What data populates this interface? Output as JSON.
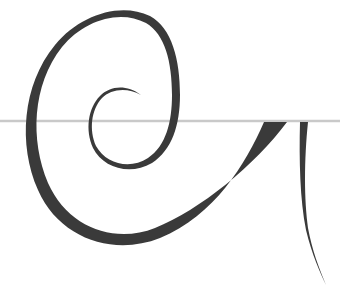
{
  "figure": {
    "colors": {
      "background": "#ffffff",
      "stroke": "#3a3a3a",
      "baseline": "#c9c9c9"
    },
    "baseline_y": 121
  }
}
